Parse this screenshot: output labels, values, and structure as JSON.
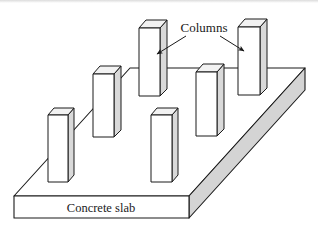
{
  "figure": {
    "background_color": "#ffffff",
    "stroke_color": "#1a1a1a",
    "labels": {
      "columns": "Columns",
      "concrete_slab": "Concrete slab"
    },
    "colors": {
      "slab_top_face": "#ffffff",
      "slab_front_face": "#ffffff",
      "slab_right_face": "#d4d4d4",
      "column_front_face": "#ffffff",
      "column_side_face": "#d9d9d9",
      "column_top_face": "#f2f2f2",
      "outline": "#1a1a1a"
    },
    "slab": {
      "name": "concrete-slab",
      "top_face_points": "14,196 130,68 305,68 189,196",
      "front_face_points": "14,196 189,196 189,218 14,218",
      "right_face_points": "189,196 305,68 305,90 189,218"
    },
    "columns": [
      {
        "id": "column-1",
        "front": "48,115 68,115 68,182 48,182",
        "side": "68,115 74,108 74,175 68,182",
        "top": "48,115 54,108 74,108 68,115"
      },
      {
        "id": "column-2",
        "front": "93,74 114,74 114,137 93,137",
        "side": "114,74 121,66 121,130 114,137",
        "top": "93,74 100,66 121,66 114,74"
      },
      {
        "id": "column-3",
        "front": "139,28 160,28 160,96 139,96",
        "side": "160,28 167,20 167,89 160,96",
        "top": "139,28 146,20 167,20 160,96"
      },
      {
        "id": "column-4",
        "front": "151,115 172,115 172,182 151,182",
        "side": "172,115 178,108 178,175 172,182",
        "top": "151,115 157,108 178,108 172,115"
      },
      {
        "id": "column-5",
        "front": "196,72 217,72 217,136 196,136",
        "side": "217,72 224,64 224,129 217,136",
        "top": "196,72 203,64 224,64 217,72"
      },
      {
        "id": "column-6",
        "front": "238,27 260,27 260,95 238,95",
        "side": "260,27 267,19 267,88 260,95",
        "top": "238,27 245,19 267,19 260,27"
      }
    ],
    "annotations": {
      "columns_label_position": {
        "x": 204,
        "y": 32
      },
      "slab_label_position": {
        "x": 101,
        "y": 211
      },
      "leader_left": {
        "from_x": 186,
        "from_y": 36,
        "to_x": 156,
        "to_y": 55
      },
      "leader_right": {
        "from_x": 220,
        "from_y": 36,
        "to_x": 245,
        "to_y": 52
      }
    }
  }
}
